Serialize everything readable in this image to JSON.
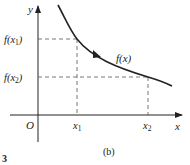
{
  "diagram": {
    "caption": "(b)",
    "figure_number": "3",
    "axes": {
      "x_label": "x",
      "y_label": "y",
      "origin_label": "O"
    },
    "curve_label": "f(x)",
    "points": [
      {
        "x_label": "x",
        "x_sub": "1",
        "y_label_pre": "f(",
        "y_sub": "1",
        "y_label_post": ")"
      },
      {
        "x_label": "x",
        "x_sub": "2",
        "y_label_pre": "f(",
        "y_sub": "2",
        "y_label_post": ")"
      }
    ],
    "colors": {
      "stroke": "#222222",
      "dash": "#555555",
      "background": "#ffffff"
    }
  }
}
